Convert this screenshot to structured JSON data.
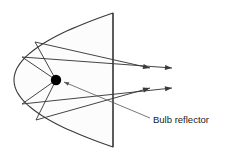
{
  "figure": {
    "canvas": {
      "width": 229,
      "height": 153,
      "background": "#ffffff"
    },
    "stroke_color": "#3a3a3a",
    "fill_color": "#fcfcfc",
    "bulb_color": "#000000",
    "label": {
      "text": "Bulb reflector",
      "x": 153,
      "y": 120,
      "font_size": 9.5,
      "color": "#1a1a1a"
    },
    "leader_line": {
      "name": "bulb-reflector-leader",
      "from_x": 150,
      "from_y": 118,
      "to_x": 64,
      "to_y": 82
    },
    "reflector": {
      "name": "parabolic-reflector",
      "vertex_x": 14,
      "vertex_y": 80,
      "aperture_x": 113,
      "top_y": 13,
      "bottom_y": 147
    },
    "aperture_line": {
      "name": "aperture-edge",
      "x": 113,
      "y1": 13,
      "y2": 147
    },
    "bulb": {
      "name": "bulb-source",
      "x": 56,
      "y": 80,
      "radius": 5.2
    },
    "rays": [
      {
        "id": "ray-1",
        "hit_x": 35,
        "hit_y": 42,
        "exit_x": 150,
        "exit_y": 68
      },
      {
        "id": "ray-2",
        "hit_x": 22,
        "hit_y": 57,
        "exit_x": 172,
        "exit_y": 68
      },
      {
        "id": "ray-3",
        "hit_x": 22,
        "hit_y": 104,
        "exit_x": 172,
        "exit_y": 88
      },
      {
        "id": "ray-4",
        "hit_x": 36,
        "hit_y": 120,
        "exit_x": 150,
        "exit_y": 88
      }
    ],
    "arrow_head": {
      "length": 7,
      "half_width": 2.6
    }
  }
}
